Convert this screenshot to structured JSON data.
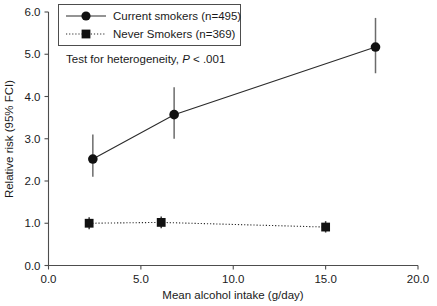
{
  "chart_data": {
    "type": "line",
    "title": "",
    "xlabel": "Mean alcohol intake (g/day)",
    "ylabel": "Relative risk (95% FCI)",
    "xlim": [
      0.0,
      20.0
    ],
    "ylim": [
      0.0,
      6.0
    ],
    "xticks": [
      "0.0",
      "5.0",
      "10.0",
      "15.0",
      "20.0"
    ],
    "xtick_values": [
      0.0,
      5.0,
      10.0,
      15.0,
      20.0
    ],
    "yticks": [
      "0.0",
      "1.0",
      "2.0",
      "3.0",
      "4.0",
      "5.0",
      "6.0"
    ],
    "ytick_values": [
      0.0,
      1.0,
      2.0,
      3.0,
      4.0,
      5.0,
      6.0
    ],
    "grid": false,
    "legend_position": "top-left",
    "annotation": "Test for heterogeneity, P < .001",
    "annotation_prefix": "Test for heterogeneity, ",
    "annotation_italic": "P",
    "annotation_suffix": " < .001",
    "series": [
      {
        "name": "Current smokers (n=495)",
        "marker": "circle",
        "linestyle": "solid",
        "x": [
          2.4,
          6.8,
          17.7
        ],
        "values": [
          2.52,
          3.57,
          5.17
        ],
        "ci_low": [
          2.1,
          3.0,
          4.55
        ],
        "ci_high": [
          3.1,
          4.22,
          5.86
        ]
      },
      {
        "name": "Never Smokers (n=369)",
        "marker": "square",
        "linestyle": "dotted",
        "x": [
          2.2,
          6.1,
          15.0
        ],
        "values": [
          1.0,
          1.02,
          0.91
        ],
        "ci_low": [
          0.86,
          0.88,
          0.78
        ],
        "ci_high": [
          1.14,
          1.16,
          1.05
        ]
      }
    ]
  },
  "legend": {
    "items": [
      {
        "label": "Current smokers (n=495)"
      },
      {
        "label": "Never Smokers (n=369)"
      }
    ]
  },
  "axes": {
    "x_title": "Mean alcohol intake (g/day)",
    "y_title": "Relative risk (95% FCI)"
  }
}
